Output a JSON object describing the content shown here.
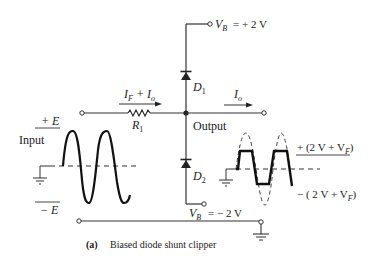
{
  "diagram": {
    "caption_letter": "(a)",
    "caption_text": "Biased diode shunt clipper",
    "labels": {
      "vb_pos": "= + 2 V",
      "vb_neg": "= − 2 V",
      "vb_symbol": "V",
      "vb_sub": "B",
      "d1": "D",
      "d1_sub": "1",
      "d2": "D",
      "d2_sub": "2",
      "r1": "R",
      "r1_sub": "1",
      "current_in": "I",
      "current_in_sub_f": "F",
      "current_in_plus": " + I",
      "current_in_sub_o": "o",
      "current_out": "I",
      "current_out_sub": "o",
      "output": "Output",
      "input": "Input",
      "plus_e": "+ E",
      "minus_e": "− E",
      "clip_pos_prefix": "+ (2 V + V",
      "clip_pos_sub": "F",
      "clip_pos_suffix": ")",
      "clip_neg_prefix": "− ( 2 V + V",
      "clip_neg_sub": "F",
      "clip_neg_suffix": ")"
    }
  }
}
